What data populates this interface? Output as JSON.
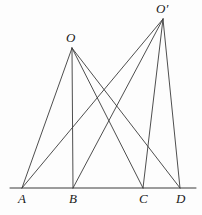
{
  "figure": {
    "background_color": "#fdfdfd",
    "stroke_color": "#3a3a3a",
    "label_color": "#1a1a1a",
    "baseline": {
      "name": "base-line",
      "x1": 10,
      "y1": 188,
      "x2": 196,
      "y2": 188
    },
    "points": {
      "A": {
        "label": "A",
        "x": 22,
        "y": 188,
        "label_x": 18,
        "label_y": 192
      },
      "B": {
        "label": "B",
        "x": 73,
        "y": 188,
        "label_x": 69,
        "label_y": 192
      },
      "C": {
        "label": "C",
        "x": 143,
        "y": 188,
        "label_x": 139,
        "label_y": 192
      },
      "D": {
        "label": "D",
        "x": 180,
        "y": 188,
        "label_x": 176,
        "label_y": 192
      },
      "O": {
        "label": "O",
        "x": 72,
        "y": 48,
        "label_x": 66,
        "label_y": 31
      },
      "Oprime": {
        "label": "O′",
        "x": 163,
        "y": 19,
        "label_x": 156,
        "label_y": 2
      }
    },
    "segments": [
      {
        "name": "segment-O-A",
        "from": "O",
        "to": "A",
        "x1": 72,
        "y1": 48,
        "x2": 22,
        "y2": 188
      },
      {
        "name": "segment-O-B",
        "from": "O",
        "to": "B",
        "x1": 72,
        "y1": 48,
        "x2": 73,
        "y2": 188
      },
      {
        "name": "segment-O-C",
        "from": "O",
        "to": "C",
        "x1": 72,
        "y1": 48,
        "x2": 143,
        "y2": 188
      },
      {
        "name": "segment-O-D",
        "from": "O",
        "to": "D",
        "x1": 72,
        "y1": 48,
        "x2": 180,
        "y2": 188
      },
      {
        "name": "segment-Oprime-A",
        "from": "Oprime",
        "to": "A",
        "x1": 163,
        "y1": 19,
        "x2": 22,
        "y2": 188
      },
      {
        "name": "segment-Oprime-B",
        "from": "Oprime",
        "to": "B",
        "x1": 163,
        "y1": 19,
        "x2": 73,
        "y2": 188
      },
      {
        "name": "segment-Oprime-C",
        "from": "Oprime",
        "to": "C",
        "x1": 163,
        "y1": 19,
        "x2": 143,
        "y2": 188
      },
      {
        "name": "segment-Oprime-D",
        "from": "Oprime",
        "to": "D",
        "x1": 163,
        "y1": 19,
        "x2": 180,
        "y2": 188
      }
    ]
  }
}
